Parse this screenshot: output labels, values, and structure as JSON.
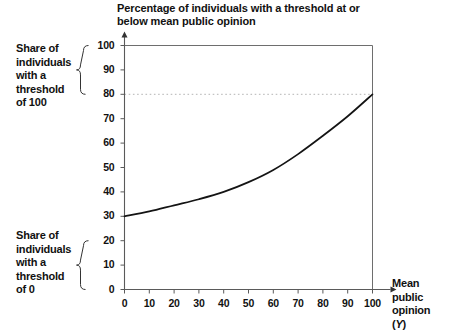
{
  "chart_data": {
    "type": "line",
    "title": "Percentage of individuals with a threshold at or below mean public opinion",
    "xlabel": "Mean public opinion (Y)",
    "ylabel": "",
    "xlim": [
      0,
      100
    ],
    "ylim": [
      0,
      100
    ],
    "grid": false,
    "legend": null,
    "x_ticks": [
      "0",
      "10",
      "20",
      "30",
      "40",
      "50",
      "60",
      "70",
      "80",
      "90",
      "100"
    ],
    "y_ticks": [
      "0",
      "10",
      "20",
      "30",
      "40",
      "50",
      "60",
      "70",
      "80",
      "90",
      "100"
    ],
    "series": [
      {
        "name": "cumulative threshold share",
        "x": [
          0,
          10,
          20,
          30,
          40,
          50,
          60,
          70,
          80,
          90,
          100
        ],
        "values": [
          30,
          32,
          34.5,
          37,
          40,
          44,
          49,
          55.5,
          63,
          71,
          80
        ]
      }
    ],
    "reference_lines": [
      {
        "name": "upper-bound-line",
        "axis": "y",
        "value": 100,
        "style": "solid"
      },
      {
        "name": "threshold-80-line",
        "axis": "y",
        "value": 80,
        "style": "dotted"
      },
      {
        "name": "right-bound-line",
        "axis": "x",
        "value": 100,
        "style": "solid"
      }
    ]
  },
  "annotations": {
    "top": {
      "text": "Share of individuals with a threshold of 100",
      "lines": [
        "Share of",
        "individuals",
        "with a",
        "threshold",
        "of 100"
      ],
      "brace_from": 80,
      "brace_to": 100
    },
    "bottom": {
      "text": "Share of individuals with a threshold of 0",
      "lines": [
        "Share of",
        "individuals",
        "with a",
        "threshold",
        "of 0"
      ],
      "brace_from": 0,
      "brace_to": 20
    }
  },
  "axis_label_x": {
    "lines": [
      "Mean",
      "public",
      "opinion",
      "(Y)"
    ],
    "italic_symbol": "Y"
  },
  "colors": {
    "curve": "#141414",
    "axis": "#5a5a5a",
    "dotted": "#b4b4b4",
    "text": "#111111",
    "background": "#ffffff"
  }
}
